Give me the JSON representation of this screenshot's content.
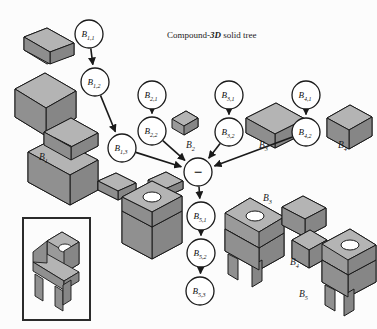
{
  "figure": {
    "title_prefix": "Compound-",
    "title_emph": "3D",
    "title_suffix": " solid tree",
    "background": "#fcfcfc"
  },
  "colors": {
    "stroke": "#1a1a1a",
    "node_fill": "#ffffff",
    "face_top": "#b4b4b4",
    "face_left": "#9a9a9a",
    "face_right": "#868686",
    "face_dark": "#707070",
    "frame": "#2b2b2b"
  },
  "tree": {
    "operator_node": {
      "name": "difference-operator",
      "symbol": "−",
      "x": 198,
      "y": 172,
      "r": 14
    },
    "nodes": [
      {
        "id": "b11",
        "base": "B",
        "sub": "1,1",
        "x": 89,
        "y": 34,
        "r": 14
      },
      {
        "id": "b12",
        "base": "B",
        "sub": "1,2",
        "x": 95,
        "y": 82,
        "r": 14
      },
      {
        "id": "b13",
        "base": "B",
        "sub": "1,3",
        "x": 122,
        "y": 148,
        "r": 14
      },
      {
        "id": "b21",
        "base": "B",
        "sub": "2,1",
        "x": 152,
        "y": 95,
        "r": 14
      },
      {
        "id": "b22",
        "base": "B",
        "sub": "2,2",
        "x": 152,
        "y": 131,
        "r": 14
      },
      {
        "id": "b31",
        "base": "B",
        "sub": "3,1",
        "x": 229,
        "y": 95,
        "r": 14
      },
      {
        "id": "b32",
        "base": "B",
        "sub": "3,2",
        "x": 229,
        "y": 132,
        "r": 14
      },
      {
        "id": "b41",
        "base": "B",
        "sub": "4,1",
        "x": 306,
        "y": 95,
        "r": 14
      },
      {
        "id": "b42",
        "base": "B",
        "sub": "4,2",
        "x": 306,
        "y": 132,
        "r": 14
      },
      {
        "id": "b51",
        "base": "B",
        "sub": "5,1",
        "x": 201,
        "y": 216,
        "r": 14
      },
      {
        "id": "b52",
        "base": "B",
        "sub": "5,2",
        "x": 201,
        "y": 253,
        "r": 14
      },
      {
        "id": "b53",
        "base": "B",
        "sub": "5,3",
        "x": 200,
        "y": 291,
        "r": 14
      }
    ],
    "edges": [
      {
        "from": "b11",
        "to": "b12"
      },
      {
        "from": "b12",
        "to": "b13"
      },
      {
        "from": "b13",
        "to": "op"
      },
      {
        "from": "b21",
        "to": "b22"
      },
      {
        "from": "b22",
        "to": "op"
      },
      {
        "from": "b31",
        "to": "b32"
      },
      {
        "from": "b32",
        "to": "op"
      },
      {
        "from": "b41",
        "to": "b42"
      },
      {
        "from": "b42",
        "to": "op"
      },
      {
        "from": "op",
        "to": "b51"
      },
      {
        "from": "b51",
        "to": "b52"
      },
      {
        "from": "b52",
        "to": "b53"
      }
    ]
  },
  "solid_labels": [
    {
      "id": "lbl-b1",
      "base": "B",
      "sub": "1",
      "x": 39,
      "y": 160
    },
    {
      "id": "lbl-b2",
      "base": "B",
      "sub": "2",
      "x": 186,
      "y": 148
    },
    {
      "id": "lbl-b3",
      "base": "B",
      "sub": "3",
      "x": 259,
      "y": 148
    },
    {
      "id": "lbl-b4",
      "base": "B",
      "sub": "4",
      "x": 338,
      "y": 148
    },
    {
      "id": "lbl-b3b",
      "base": "B",
      "sub": "3",
      "x": 263,
      "y": 201
    },
    {
      "id": "lbl-b4b",
      "base": "B",
      "sub": "4",
      "x": 290,
      "y": 265
    },
    {
      "id": "lbl-b5",
      "base": "B",
      "sub": "5",
      "x": 299,
      "y": 297
    }
  ],
  "result_frame": {
    "name": "result-solid-frame",
    "x": 23,
    "y": 218,
    "w": 67,
    "h": 102
  },
  "legend": {
    "operator_meaning": "difference",
    "solid_count": 5
  }
}
